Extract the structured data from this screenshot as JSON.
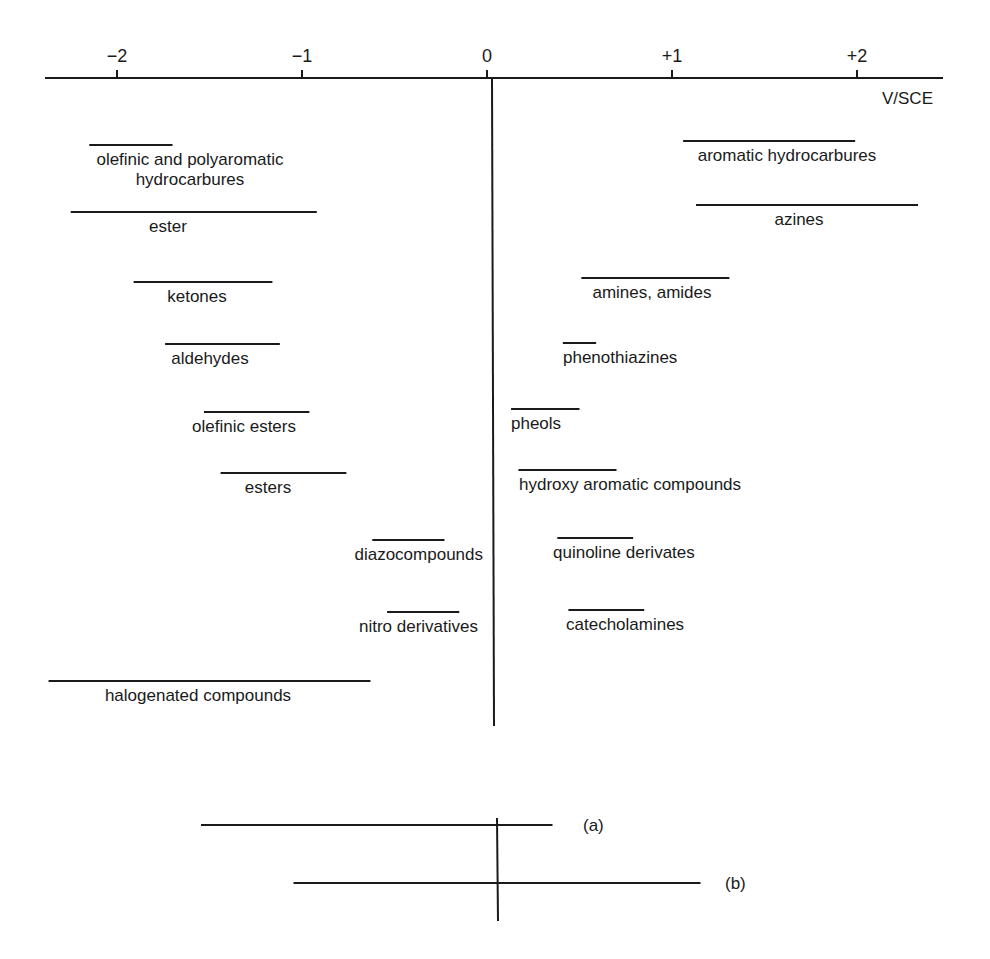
{
  "chart_data": {
    "type": "range-bar",
    "title": "",
    "xlabel": "V/SCE",
    "ylabel": "",
    "xlim": [
      -2.4,
      2.5
    ],
    "grid": false,
    "x_ticks": [
      {
        "value": -2,
        "label": "−2"
      },
      {
        "value": -1,
        "label": "−1"
      },
      {
        "value": 0,
        "label": "0"
      },
      {
        "value": 1,
        "label": "+1"
      },
      {
        "value": 2,
        "label": "+2"
      }
    ],
    "reduction_side": [
      {
        "label": [
          "olefinic and polyaromatic",
          "hydrocarbures"
        ],
        "range": [
          -2.15,
          -1.7
        ]
      },
      {
        "label": [
          "ester"
        ],
        "range": [
          -2.25,
          -0.92
        ]
      },
      {
        "label": [
          "ketones"
        ],
        "range": [
          -1.91,
          -1.16
        ]
      },
      {
        "label": [
          "aldehydes"
        ],
        "range": [
          -1.74,
          -1.12
        ]
      },
      {
        "label": [
          "olefinic esters"
        ],
        "range": [
          -1.53,
          -0.96
        ]
      },
      {
        "label": [
          "esters"
        ],
        "range": [
          -1.44,
          -0.76
        ]
      },
      {
        "label": [
          "diazocompounds"
        ],
        "range": [
          -0.62,
          -0.23
        ]
      },
      {
        "label": [
          "nitro derivatives"
        ],
        "range": [
          -0.54,
          -0.15
        ]
      },
      {
        "label": [
          "halogenated compounds"
        ],
        "range": [
          -2.37,
          -0.63
        ]
      }
    ],
    "oxidation_side": [
      {
        "label": [
          "aromatic hydrocarbures"
        ],
        "range": [
          1.06,
          1.99
        ]
      },
      {
        "label": [
          "azines"
        ],
        "range": [
          1.13,
          2.33
        ]
      },
      {
        "label": [
          "amines, amides"
        ],
        "range": [
          0.51,
          1.31
        ]
      },
      {
        "label": [
          "phenothiazines"
        ],
        "range": [
          0.41,
          0.59
        ]
      },
      {
        "label": [
          "pheols"
        ],
        "range": [
          0.13,
          0.5
        ]
      },
      {
        "label": [
          "hydroxy aromatic compounds"
        ],
        "range": [
          0.17,
          0.7
        ]
      },
      {
        "label": [
          "quinoline derivates"
        ],
        "range": [
          0.38,
          0.79
        ]
      },
      {
        "label": [
          "catecholamines"
        ],
        "range": [
          0.44,
          0.85
        ]
      }
    ],
    "electrode_windows": [
      {
        "label": "(a)",
        "range": [
          -1.6,
          0.3
        ]
      },
      {
        "label": "(b)",
        "range": [
          -1.1,
          1.1
        ]
      }
    ]
  }
}
